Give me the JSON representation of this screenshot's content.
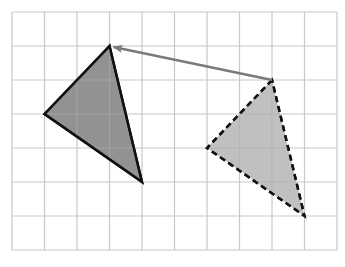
{
  "diagram": {
    "grid": {
      "columns": 10,
      "rows": 7,
      "origin_px": [
        12,
        12
      ],
      "cell_w": 32.5,
      "cell_h": 34,
      "line_color": "#c8c8c8"
    },
    "shapes": [
      {
        "id": "image-triangle",
        "style": "solid",
        "fill": "#8c8c8c",
        "fill_opacity": 0.95,
        "stroke": "#111111",
        "vertices_grid": [
          [
            3,
            1
          ],
          [
            1,
            3
          ],
          [
            4,
            5
          ]
        ]
      },
      {
        "id": "preimage-triangle",
        "style": "dashed",
        "fill": "#bdbdbd",
        "fill_opacity": 0.95,
        "stroke": "#111111",
        "vertices_grid": [
          [
            8,
            2
          ],
          [
            6,
            4
          ],
          [
            9,
            6
          ]
        ]
      }
    ],
    "arrow": {
      "id": "translation-arrow",
      "from_grid": [
        8,
        2
      ],
      "to_grid": [
        3,
        1
      ],
      "color": "#7a7a7a",
      "vector": [
        -5,
        -1
      ]
    }
  }
}
